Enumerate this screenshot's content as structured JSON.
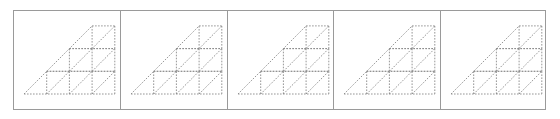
{
  "figure": {
    "type": "diagram",
    "panel_count": 5,
    "panel_widths": [
      107,
      107,
      106,
      107,
      105
    ],
    "colors": {
      "border": "#9a9a9a",
      "line": "#8a8a8a",
      "background": "#ffffff"
    },
    "shape": {
      "cell_size": 22.7,
      "origin": [
        10,
        83
      ],
      "rows": [
        {
          "row": 0,
          "cells_from_col": 1,
          "cells_to_col": 4,
          "triangle_col": 0
        },
        {
          "row": 1,
          "cells_from_col": 2,
          "cells_to_col": 4,
          "triangle_col": 1
        },
        {
          "row": 2,
          "cells_from_col": 3,
          "cells_to_col": 4,
          "triangle_col": 2
        }
      ],
      "diagonal_direction": "bottom-left-to-top-right",
      "line_style": "dotted"
    }
  }
}
